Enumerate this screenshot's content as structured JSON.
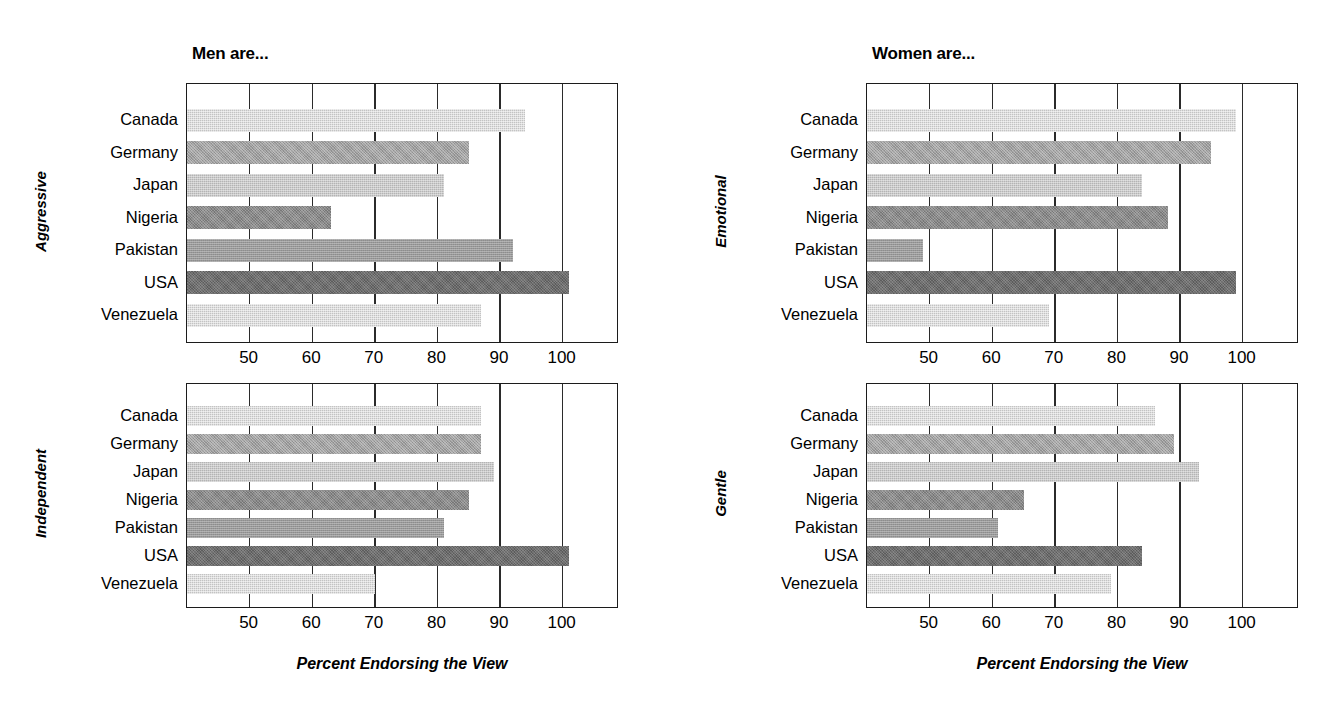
{
  "figure": {
    "background": "#ffffff",
    "ink": "#1c1c1c"
  },
  "panels": [
    {
      "id": "men-aggressive",
      "title": "Men are...",
      "ylabel": "Aggressive",
      "xlabel": "",
      "show_xlabel": false
    },
    {
      "id": "women-emotional",
      "title": "Women are...",
      "ylabel": "Emotional",
      "xlabel": "",
      "show_xlabel": false
    },
    {
      "id": "men-independent",
      "title": "",
      "ylabel": "Independent",
      "xlabel": "Percent Endorsing the View",
      "show_xlabel": true
    },
    {
      "id": "women-gentle",
      "title": "",
      "ylabel": "Gentle",
      "xlabel": "Percent Endorsing the View",
      "show_xlabel": true
    }
  ],
  "chart_data": [
    {
      "type": "bar",
      "orientation": "horizontal",
      "id": "men-aggressive",
      "title": "Men are...",
      "ylabel": "Aggressive",
      "xlabel": "",
      "categories": [
        "Canada",
        "Germany",
        "Japan",
        "Nigeria",
        "Pakistan",
        "USA",
        "Venezuela"
      ],
      "values": [
        94,
        85,
        81,
        63,
        92,
        101,
        87
      ],
      "ticks": [
        50,
        60,
        70,
        80,
        90,
        100
      ],
      "xlim": [
        40,
        109
      ],
      "grid": true,
      "legend": "none"
    },
    {
      "type": "bar",
      "orientation": "horizontal",
      "id": "women-emotional",
      "title": "Women are...",
      "ylabel": "Emotional",
      "xlabel": "",
      "categories": [
        "Canada",
        "Germany",
        "Japan",
        "Nigeria",
        "Pakistan",
        "USA",
        "Venezuela"
      ],
      "values": [
        99,
        95,
        84,
        88,
        49,
        99,
        69
      ],
      "ticks": [
        50,
        60,
        70,
        80,
        90,
        100
      ],
      "xlim": [
        40,
        109
      ],
      "grid": true,
      "legend": "none"
    },
    {
      "type": "bar",
      "orientation": "horizontal",
      "id": "men-independent",
      "title": "",
      "ylabel": "Independent",
      "xlabel": "Percent Endorsing the View",
      "categories": [
        "Canada",
        "Germany",
        "Japan",
        "Nigeria",
        "Pakistan",
        "USA",
        "Venezuela"
      ],
      "values": [
        87,
        87,
        89,
        85,
        81,
        101,
        70
      ],
      "ticks": [
        50,
        60,
        70,
        80,
        90,
        100
      ],
      "xlim": [
        40,
        109
      ],
      "grid": true,
      "legend": "none"
    },
    {
      "type": "bar",
      "orientation": "horizontal",
      "id": "women-gentle",
      "title": "",
      "ylabel": "Gentle",
      "xlabel": "Percent Endorsing the View",
      "categories": [
        "Canada",
        "Germany",
        "Japan",
        "Nigeria",
        "Pakistan",
        "USA",
        "Venezuela"
      ],
      "values": [
        86,
        89,
        93,
        65,
        61,
        84,
        79
      ],
      "ticks": [
        50,
        60,
        70,
        80,
        90,
        100
      ],
      "xlim": [
        40,
        109
      ],
      "grid": true,
      "legend": "none"
    }
  ],
  "bar_fill_classes": [
    "fill-l1",
    "fill-m1",
    "fill-l2",
    "fill-d1",
    "fill-m2",
    "fill-d2",
    "fill-l1"
  ],
  "tick_labels": [
    "50",
    "60",
    "70",
    "80",
    "90",
    "100"
  ],
  "category_labels": [
    "Canada",
    "Germany",
    "Japan",
    "Nigeria",
    "Pakistan",
    "USA",
    "Venezuela"
  ]
}
